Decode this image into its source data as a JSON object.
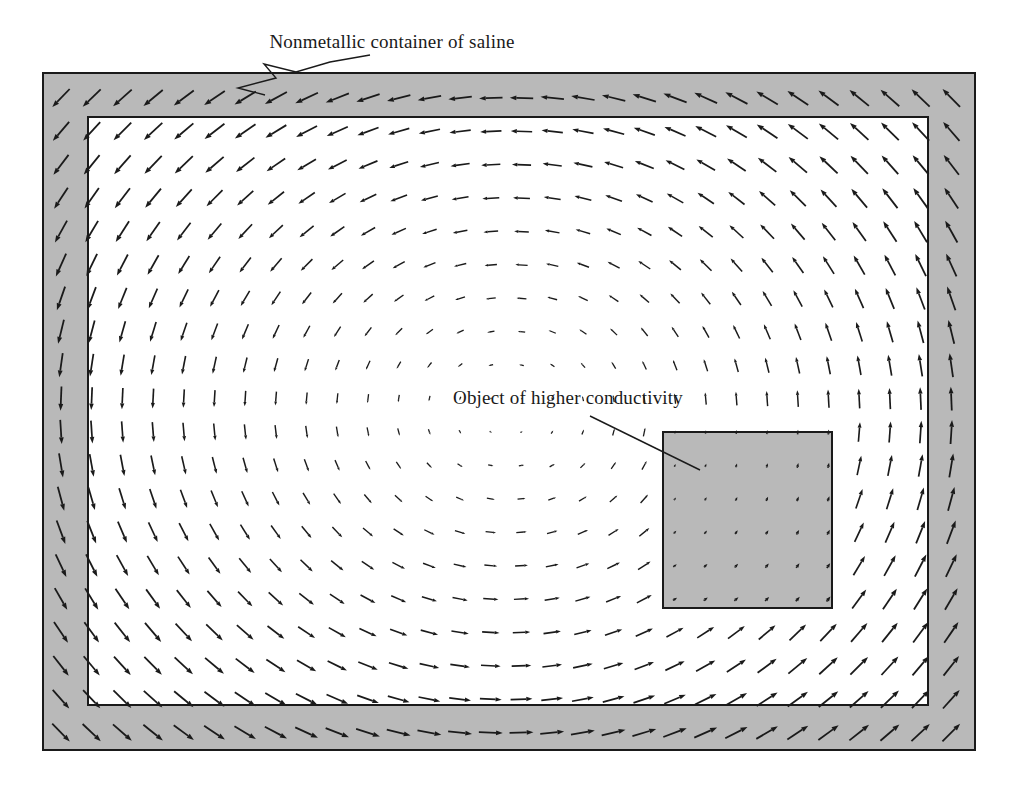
{
  "figure": {
    "title_visible": false,
    "background_color": "#ffffff",
    "width": 1016,
    "height": 793
  },
  "annotations": [
    {
      "id": "container-label",
      "text": "Nonmetallic container of saline",
      "x": 392,
      "y": 48,
      "anchor": "middle",
      "leader": {
        "type": "zigzag",
        "points": "370,55 330,62 296,72 264,64 276,78 238,88 265,95"
      }
    },
    {
      "id": "object-label",
      "text": "Object of higher conductivity",
      "x": 568,
      "y": 404,
      "anchor": "middle",
      "leader": {
        "type": "straight",
        "points": "590,416 700,470"
      }
    }
  ],
  "shapes": {
    "container_wall": {
      "name": "Nonmetallic container of saline",
      "x": 43,
      "y": 73,
      "width": 932,
      "height": 677,
      "fill": "#b9b9b9",
      "stroke": "#1a1a1a",
      "stroke_width": 2
    },
    "saline_interior": {
      "name": "Saline interior",
      "x": 88,
      "y": 117,
      "width": 840,
      "height": 588,
      "fill": "#ffffff",
      "stroke": "#1a1a1a",
      "stroke_width": 2
    },
    "conductive_object": {
      "name": "Object of higher conductivity",
      "x": 663,
      "y": 432,
      "width": 169,
      "height": 176,
      "fill": "#b9b9b9",
      "stroke": "#1a1a1a",
      "stroke_width": 2
    }
  },
  "chart_data": {
    "type": "quiver",
    "title": "",
    "xlabel": "",
    "ylabel": "",
    "grid": {
      "columns": 30,
      "rows": 20,
      "x_start": 61,
      "y_start": 98,
      "dx": 30.7,
      "dy": 33.4
    },
    "field": {
      "pattern": "clockwise-circulation",
      "center_x": 0.5,
      "center_y": 0.5,
      "max_arrow_length": 25,
      "stagnation_point": true,
      "object_attenuation": 0.28
    },
    "arrow_style": {
      "color": "#1a1a1a",
      "shaft_width": 1.8,
      "head_length": 7,
      "head_width": 5
    },
    "legend": []
  }
}
